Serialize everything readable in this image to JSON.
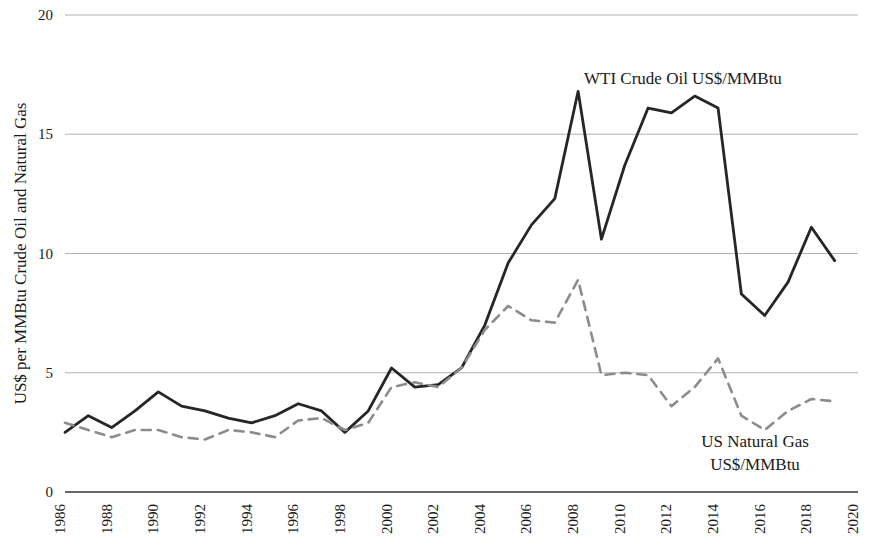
{
  "chart_data": {
    "type": "line",
    "title": "",
    "xlabel": "",
    "ylabel": "US$ per MMBtu Crude Oil and Natural Gas",
    "xlim": [
      1986,
      2020
    ],
    "ylim": [
      0,
      20
    ],
    "xticks": [
      1986,
      1988,
      1990,
      1992,
      1994,
      1996,
      1998,
      2000,
      2002,
      2004,
      2006,
      2008,
      2010,
      2012,
      2014,
      2016,
      2018,
      2020
    ],
    "yticks": [
      0,
      5,
      10,
      15,
      20
    ],
    "grid": true,
    "legend_position": "inline-annotation",
    "x": [
      1986,
      1987,
      1988,
      1989,
      1990,
      1991,
      1992,
      1993,
      1994,
      1995,
      1996,
      1997,
      1998,
      1999,
      2000,
      2001,
      2002,
      2003,
      2004,
      2005,
      2006,
      2007,
      2008,
      2009,
      2010,
      2011,
      2012,
      2013,
      2014,
      2015,
      2016,
      2017,
      2018,
      2019
    ],
    "series": [
      {
        "name": "WTI Crude Oil US$/MMBtu",
        "style": "solid",
        "color": "#262626",
        "values": [
          2.5,
          3.2,
          2.7,
          3.4,
          4.2,
          3.6,
          3.4,
          3.1,
          2.9,
          3.2,
          3.7,
          3.4,
          2.5,
          3.4,
          5.2,
          4.4,
          4.5,
          5.2,
          7.0,
          9.6,
          11.2,
          12.3,
          16.8,
          10.6,
          13.7,
          16.1,
          15.9,
          16.6,
          16.1,
          8.3,
          7.4,
          8.8,
          11.1,
          9.7
        ]
      },
      {
        "name": "US Natural Gas US$/MMBtu",
        "style": "dashed",
        "color": "#8c8c8c",
        "values": [
          2.9,
          2.6,
          2.3,
          2.6,
          2.6,
          2.3,
          2.2,
          2.6,
          2.5,
          2.3,
          3.0,
          3.1,
          2.6,
          2.9,
          4.4,
          4.6,
          4.4,
          5.2,
          6.8,
          7.8,
          7.2,
          7.1,
          8.9,
          4.9,
          5.0,
          4.9,
          3.6,
          4.4,
          5.6,
          3.2,
          2.6,
          3.4,
          3.9,
          3.8
        ]
      }
    ],
    "annotations": [
      {
        "name": "wti-crude-oil-series-label",
        "text": "WTI Crude Oil US$/MMBtu",
        "x_px": 584,
        "y_px": 84,
        "anchor": "start"
      },
      {
        "name": "us-natural-gas-series-label-line1",
        "text": "US Natural Gas",
        "x_px": 755,
        "y_px": 447,
        "anchor": "middle"
      },
      {
        "name": "us-natural-gas-series-label-line2",
        "text": "US$/MMBtu",
        "x_px": 755,
        "y_px": 470,
        "anchor": "middle"
      }
    ],
    "colors": {
      "gridline": "#b3b3b3",
      "axis": "#333333",
      "background": "#ffffff",
      "oil_line": "#262626",
      "gas_line": "#8c8c8c"
    }
  }
}
